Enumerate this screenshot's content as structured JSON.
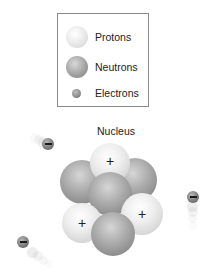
{
  "legend": {
    "items": [
      {
        "label": "Protons",
        "swatch": "proton"
      },
      {
        "label": "Neutrons",
        "swatch": "neutron"
      },
      {
        "label": "Electrons",
        "swatch": "electron"
      }
    ]
  },
  "nucleus": {
    "title": "Nucleus",
    "particles": [
      {
        "type": "neutron",
        "symbol": ""
      },
      {
        "type": "neutron",
        "symbol": ""
      },
      {
        "type": "proton",
        "symbol": "+"
      },
      {
        "type": "neutron",
        "symbol": ""
      },
      {
        "type": "proton",
        "symbol": "+"
      },
      {
        "type": "proton",
        "symbol": "+"
      },
      {
        "type": "neutron",
        "symbol": ""
      }
    ]
  },
  "electrons": [
    {
      "symbol": "−"
    },
    {
      "symbol": "−"
    },
    {
      "symbol": "−"
    }
  ],
  "colors": {
    "proton": "#eeeeee",
    "neutron": "#a9a9a9",
    "electron": "#7d7d7d",
    "legend_border": "#8a8a8a"
  }
}
